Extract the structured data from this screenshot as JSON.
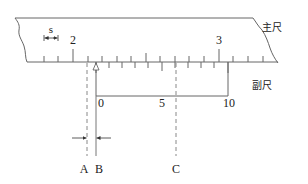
{
  "diagram": {
    "labels": {
      "main_scale": "主尺",
      "vernier_scale": "副尺",
      "spacing_symbol": "s",
      "main_number_2": "2",
      "main_number_3": "3",
      "vernier_0": "0",
      "vernier_5": "5",
      "vernier_10": "10",
      "line_a": "A",
      "line_b": "B",
      "line_c": "C"
    },
    "colors": {
      "stroke": "#555555",
      "dashed": "#888888",
      "text": "#222222"
    },
    "main_scale": {
      "tick_count": 16,
      "major_tick_labels": [
        "2",
        "3"
      ]
    },
    "vernier_scale": {
      "divisions": 10,
      "major_tick_labels": [
        "0",
        "5",
        "10"
      ]
    }
  }
}
